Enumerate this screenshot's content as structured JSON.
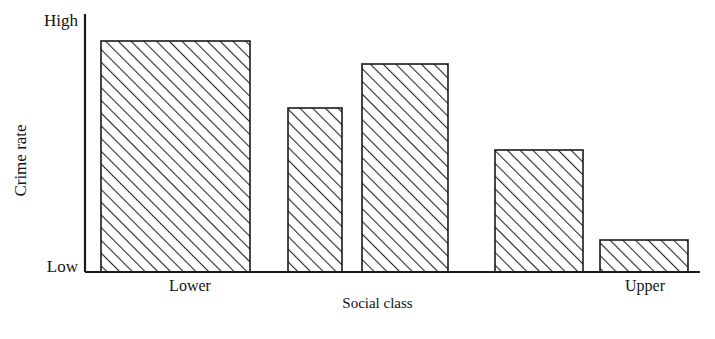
{
  "chart_data": {
    "type": "bar",
    "title": "",
    "subtitle": "",
    "xlabel": "Social class",
    "ylabel": "Crime rate",
    "categories": [
      "Lower",
      "",
      "",
      "",
      "Upper"
    ],
    "values": [
      0.9,
      0.64,
      0.81,
      0.47,
      0.12
    ],
    "ylim": [
      0,
      1
    ],
    "ytick_labels": [
      "Low",
      "High"
    ],
    "ytick_values": [
      0,
      1
    ],
    "xtick_labels": [
      "Lower",
      "Upper"
    ],
    "grid": false,
    "legend": null,
    "annotations": [],
    "series": [
      {
        "name": "Crime rate",
        "values": [
          0.9,
          0.64,
          0.81,
          0.47,
          0.12
        ]
      }
    ],
    "bar_style": {
      "fill": "white",
      "edge_color": "#1a1a1a",
      "hatch": "diagonal-lines"
    }
  },
  "axes": {
    "y_axis_title": "Crime rate",
    "x_axis_title": "Social class",
    "y_top_label": "High",
    "y_bottom_label": "Low",
    "x_first_label": "Lower",
    "x_last_label": "Upper"
  },
  "colors": {
    "ink": "#1a1a1a",
    "background": "#ffffff",
    "bar_fill": "#ffffff",
    "bar_edge": "#1a1a1a",
    "hatch": "#2a2a2a"
  },
  "geometry": {
    "baseline_y": 272,
    "axis_x": 85,
    "axis_top_y": 14,
    "axis_right_x": 700,
    "bars": [
      {
        "x": 101,
        "width": 149,
        "top": 41,
        "label": "Lower",
        "label_center": 190
      },
      {
        "x": 288,
        "width": 54,
        "top": 108,
        "label": "",
        "label_center": 315
      },
      {
        "x": 362,
        "width": 86,
        "top": 64,
        "label": "",
        "label_center": 405
      },
      {
        "x": 495,
        "width": 88,
        "top": 150,
        "label": "",
        "label_center": 539
      },
      {
        "x": 600,
        "width": 88,
        "top": 240,
        "label": "Upper",
        "label_center": 645
      }
    ]
  }
}
